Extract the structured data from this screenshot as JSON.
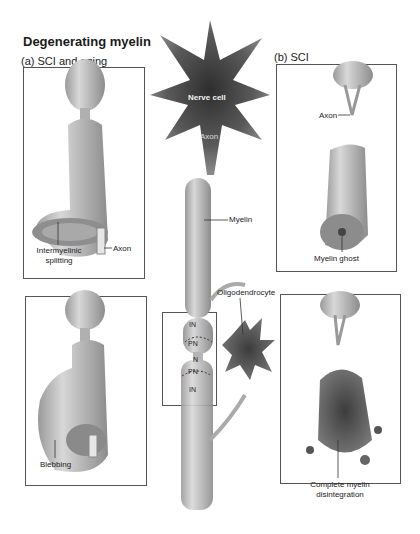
{
  "figure": {
    "title": "Degenerating myelin",
    "panel_a": {
      "heading": "(a) SCI and aging",
      "top_box": {
        "labels": {
          "intermyelinic_splitting": "Intermyelinic\nsplitting",
          "axon": "Axon"
        }
      },
      "bottom_box": {
        "labels": {
          "blebbing": "Blebbing"
        }
      }
    },
    "center": {
      "labels": {
        "nerve_cell": "Nerve cell",
        "axon": "Axon",
        "myelin": "Myelin",
        "oligodendrocyte": "Oligodendrocyte"
      },
      "node_region": {
        "IN_top": "IN",
        "PN_top": "PN",
        "N": "N",
        "PN_bottom": "PN",
        "IN_bottom": "IN"
      }
    },
    "panel_b": {
      "heading": "(b) SCI",
      "top_box": {
        "labels": {
          "axon": "Axon",
          "myelin_ghost": "Myelin ghost"
        }
      },
      "bottom_box": {
        "labels": {
          "complete_disintegration_line1": "Complete myelin",
          "complete_disintegration_line2": "disintegration"
        }
      }
    }
  },
  "colors": {
    "myelin_light": "#c9c9c9",
    "myelin_dark": "#8a8a8a",
    "cell_dark": "#4a4a4a",
    "frame": "#555555"
  }
}
